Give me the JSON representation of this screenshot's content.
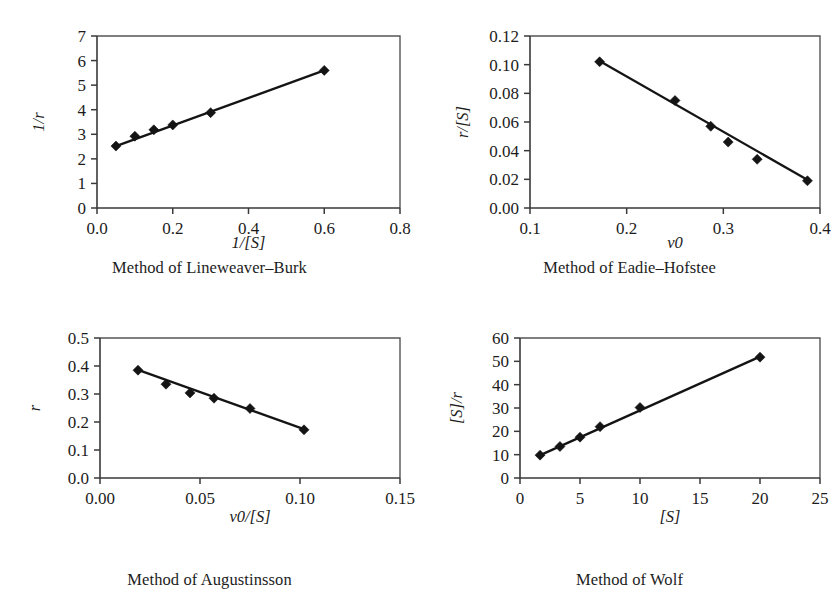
{
  "figure": {
    "panel_count": 4,
    "background_color": "#ffffff",
    "marker_color": "#141414",
    "line_color": "#141414",
    "axis_color": "#3a3a3a"
  },
  "chart_data": [
    {
      "id": "lineweaver-burk",
      "type": "scatter",
      "title": "Method of Lineweaver–Burk",
      "xlabel": "1/[S]",
      "ylabel": "1/r",
      "xlim": [
        0.0,
        0.8
      ],
      "ylim": [
        0,
        7
      ],
      "xticks": [
        0.0,
        0.2,
        0.4,
        0.6,
        0.8
      ],
      "xticklabels": [
        "0.0",
        "0.2",
        "0.4",
        "0.6",
        "0.8"
      ],
      "yticks": [
        0,
        1,
        2,
        3,
        4,
        5,
        6,
        7
      ],
      "yticklabels": [
        "0",
        "1",
        "2",
        "3",
        "4",
        "5",
        "6",
        "7"
      ],
      "grid": false,
      "legend": "none",
      "x": [
        0.05,
        0.1,
        0.15,
        0.2,
        0.3,
        0.6
      ],
      "y": [
        2.52,
        2.92,
        3.18,
        3.38,
        3.88,
        5.6
      ],
      "fit_line": {
        "x": [
          0.05,
          0.6
        ],
        "y": [
          2.52,
          5.6
        ]
      }
    },
    {
      "id": "eadie-hofstee",
      "type": "scatter",
      "title": "Method of Eadie–Hofstee",
      "xlabel": "v0",
      "ylabel": "r/[S]",
      "xlim": [
        0.1,
        0.4
      ],
      "ylim": [
        0.0,
        0.12
      ],
      "xticks": [
        0.1,
        0.2,
        0.3,
        0.4
      ],
      "xticklabels": [
        "0.1",
        "0.2",
        "0.3",
        "0.4"
      ],
      "yticks": [
        0.0,
        0.02,
        0.04,
        0.06,
        0.08,
        0.1,
        0.12
      ],
      "yticklabels": [
        "0.00",
        "0.02",
        "0.04",
        "0.06",
        "0.08",
        "0.10",
        "0.12"
      ],
      "grid": false,
      "legend": "none",
      "x": [
        0.172,
        0.25,
        0.287,
        0.305,
        0.335,
        0.387
      ],
      "y": [
        0.102,
        0.075,
        0.057,
        0.046,
        0.034,
        0.019
      ],
      "fit_line": {
        "x": [
          0.172,
          0.39
        ],
        "y": [
          0.1025,
          0.0185
        ]
      }
    },
    {
      "id": "augustinsson",
      "type": "scatter",
      "title": "Method of Augustinsson",
      "xlabel": "v0/[S]",
      "ylabel": "r",
      "xlim": [
        0.0,
        0.15
      ],
      "ylim": [
        0.0,
        0.5
      ],
      "xticks": [
        0.0,
        0.05,
        0.1,
        0.15
      ],
      "xticklabels": [
        "0.00",
        "0.05",
        "0.10",
        "0.15"
      ],
      "yticks": [
        0.0,
        0.1,
        0.2,
        0.3,
        0.4,
        0.5
      ],
      "yticklabels": [
        "0.0",
        "0.1",
        "0.2",
        "0.3",
        "0.4",
        "0.5"
      ],
      "grid": false,
      "legend": "none",
      "x": [
        0.019,
        0.033,
        0.045,
        0.057,
        0.075,
        0.102
      ],
      "y": [
        0.385,
        0.335,
        0.304,
        0.285,
        0.248,
        0.172
      ],
      "fit_line": {
        "x": [
          0.019,
          0.103
        ],
        "y": [
          0.386,
          0.172
        ]
      }
    },
    {
      "id": "wolf",
      "type": "scatter",
      "title": "Method of Wolf",
      "xlabel": "[S]",
      "ylabel": "[S]/r",
      "xlim": [
        0,
        25
      ],
      "ylim": [
        0,
        60
      ],
      "xticks": [
        0,
        5,
        10,
        15,
        20,
        25
      ],
      "xticklabels": [
        "0",
        "5",
        "10",
        "15",
        "20",
        "25"
      ],
      "yticks": [
        0,
        10,
        20,
        30,
        40,
        50,
        60
      ],
      "yticklabels": [
        "0",
        "10",
        "20",
        "30",
        "40",
        "50",
        "60"
      ],
      "grid": false,
      "legend": "none",
      "x": [
        1.67,
        3.33,
        5.0,
        6.67,
        10.0,
        20.0
      ],
      "y": [
        9.8,
        13.5,
        17.5,
        22.0,
        30.2,
        51.8
      ],
      "fit_line": {
        "x": [
          1.6,
          20.0
        ],
        "y": [
          9.6,
          52.0
        ]
      }
    }
  ]
}
